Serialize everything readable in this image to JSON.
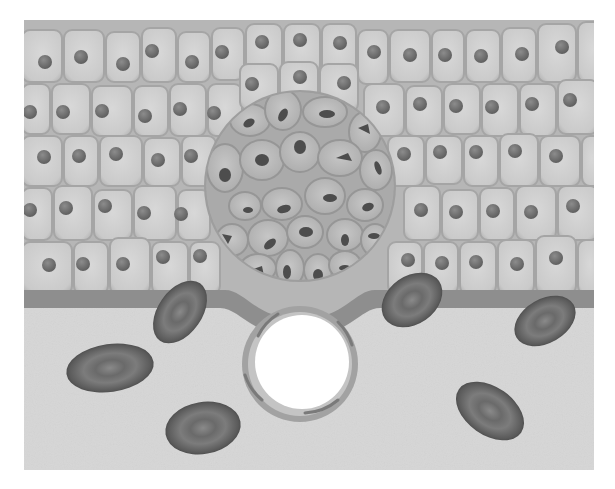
{
  "figure": {
    "description": "Epithelium with carcinoma in situ above intact basement membrane; connective tissue below containing fibroblasts and a capillary",
    "colors": {
      "background": "#ffffff",
      "cell_fill": "#cdcdcd",
      "cell_edge": "#a9a9a9",
      "nucleus": "#6f6f6f",
      "tumor_fill": "#b9b9b9",
      "tumor_nucleus": "#4a4a4a",
      "basement_membrane": "#8e8e8e",
      "stroma": "#d6d6d6",
      "fibroblast": "#5a5a5a",
      "vessel_wall": "#9a9a9a",
      "vessel_lumen": "#ffffff"
    },
    "regions": {
      "epithelium": "epithelium",
      "tumor": "carcinoma-in-situ",
      "membrane": "basement-membrane",
      "stroma": "connective-tissue",
      "vessel": "blood-vessel"
    },
    "fibroblast_count": 6,
    "epithelial_rows": 5
  }
}
